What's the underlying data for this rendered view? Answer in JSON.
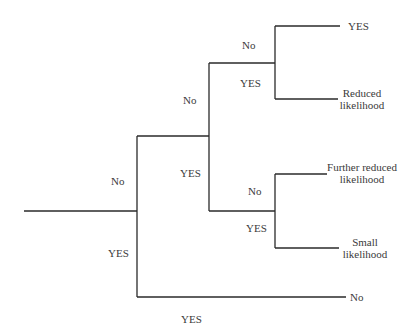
{
  "tree": {
    "edge_labels": {
      "root_no": "No",
      "root_yes": "YES",
      "n1_no": "No",
      "n1_yes": "YES",
      "n2_no": "No",
      "n2_yes": "YES",
      "n3_no": "No",
      "n3_yes": "YES",
      "bottom_yes": "YES"
    },
    "leaves": {
      "top_yes": "YES",
      "reduced_1": "Reduced",
      "reduced_2": "likelihood",
      "further_1": "Further reduced",
      "further_2": "likelihood",
      "small_1": "Small",
      "small_2": "likelihood",
      "bottom_no": "No"
    },
    "line_color": "#2a2a2a"
  }
}
